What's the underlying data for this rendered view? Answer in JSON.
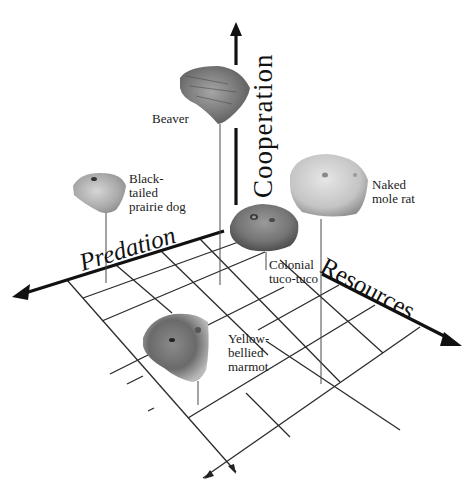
{
  "diagram": {
    "type": "3d-axis-diagram",
    "axes": {
      "vertical": {
        "label": "Cooperation"
      },
      "left": {
        "label": "Predation"
      },
      "right": {
        "label": "Resources"
      }
    },
    "species": [
      {
        "id": "beaver",
        "label": "Beaver"
      },
      {
        "id": "prairie-dog",
        "label": "Black-\ntailed\nprairie dog"
      },
      {
        "id": "mole-rat",
        "label": "Naked\nmole rat"
      },
      {
        "id": "tuco-tuco",
        "label": "Colonial\ntuco-tuco"
      },
      {
        "id": "marmot",
        "label": "Yellow-\nbellied\nmarmot"
      }
    ],
    "colors": {
      "axis": "#111111",
      "grid": "#2a2a2a",
      "stem": "#555555",
      "background": "#ffffff"
    }
  }
}
